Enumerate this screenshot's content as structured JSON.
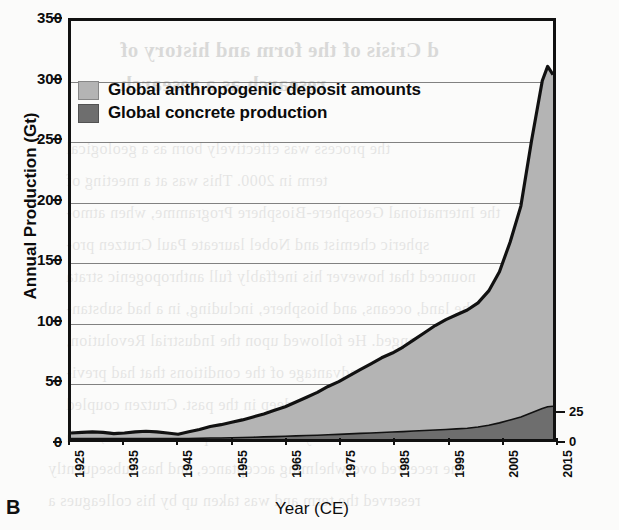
{
  "panel_label": "B",
  "axes": {
    "y_left": {
      "title": "Annual Production (Gt)",
      "ticks": [
        0,
        50,
        100,
        150,
        200,
        250,
        300,
        350
      ],
      "min": 0,
      "max": 350
    },
    "y_right": {
      "title": "",
      "ticks": [
        0,
        25
      ],
      "min": 0,
      "max": 350
    },
    "x": {
      "title": "Year (CE)",
      "ticks": [
        1925,
        1935,
        1945,
        1955,
        1965,
        1975,
        1985,
        1995,
        2005,
        2015
      ],
      "min": 1925,
      "max": 2015
    }
  },
  "legend": {
    "position": "top-left-inside",
    "entries": [
      {
        "label": "Global anthropogenic deposit amounts",
        "color": "#b4b4b4",
        "swatch": "legend-swatch-anthropogenic"
      },
      {
        "label": "Global concrete production",
        "color": "#6e6e6e",
        "swatch": "legend-swatch-concrete"
      }
    ]
  },
  "colors": {
    "anthropogenic_fill": "#b4b4b4",
    "concrete_fill": "#6e6e6e",
    "line": "#111111",
    "grid": "#6b6b6b",
    "frame": "#111111",
    "page": "#fbfbfa"
  },
  "bleed_text": {
    "note": "faint mirrored show-through text from reverse of scanned page",
    "lines": [
      "d Crisis of the form and history of",
      "research as a research",
      "the process was effectively born as a geological",
      "term in 2000. This was at a meeting of",
      "the International Geosphere-Biosphere Programme, when atmo-",
      "spheric chemist and Nobel laureate Paul Crutzen pro-",
      "nounced that however his ineffably full  anthropogenic strata",
      "the land, oceans, and biosphere, including, in a had substan-",
      "tially changed. He followed upon the Industrial Revolution,",
      "taking advantage of the conditions that had previ-",
      "ously been so deep in the past.  Crutzen coupled",
      "the boundary of the Anthropocene in 2000, with",
      "the received overwhelming acceptance, and has subsequently",
      "reserved the term and was taken up by his colleagues a"
    ]
  },
  "chart_data": {
    "type": "area",
    "title": "",
    "subtitle": "",
    "xlabel": "Year (CE)",
    "ylabel": "Annual Production (Gt)",
    "xlim": [
      1925,
      2015
    ],
    "ylim": [
      0,
      350
    ],
    "y2lim": [
      0,
      350
    ],
    "grid": true,
    "stacked": false,
    "legend_position": "upper left",
    "x": [
      1925,
      1927,
      1929,
      1931,
      1933,
      1935,
      1937,
      1939,
      1941,
      1943,
      1945,
      1947,
      1949,
      1951,
      1953,
      1955,
      1957,
      1959,
      1961,
      1963,
      1965,
      1967,
      1969,
      1971,
      1973,
      1975,
      1977,
      1979,
      1981,
      1983,
      1985,
      1987,
      1989,
      1991,
      1993,
      1995,
      1997,
      1999,
      2001,
      2003,
      2005,
      2007,
      2009,
      2011,
      2013,
      2014,
      2015
    ],
    "series": [
      {
        "name": "Global anthropogenic deposit amounts",
        "axis": "left",
        "color": "#b4b4b4",
        "values": [
          5,
          5.5,
          6,
          5.5,
          4.5,
          5,
          6,
          6.5,
          6,
          5,
          4,
          6,
          8,
          10.5,
          12,
          14,
          16,
          18.5,
          21,
          24,
          27,
          31,
          35,
          39,
          44,
          48,
          53,
          58,
          63,
          68,
          72,
          77,
          83,
          89,
          95,
          100,
          104,
          108,
          114,
          124,
          140,
          165,
          195,
          250,
          300,
          312,
          305
        ]
      },
      {
        "name": "Global concrete production",
        "axis": "right",
        "color": "#6e6e6e",
        "values": [
          0.3,
          0.3,
          0.4,
          0.35,
          0.3,
          0.35,
          0.4,
          0.45,
          0.4,
          0.35,
          0.3,
          0.4,
          0.6,
          0.8,
          0.9,
          1.1,
          1.3,
          1.5,
          1.8,
          2.0,
          2.3,
          2.6,
          2.9,
          3.2,
          3.6,
          3.9,
          4.3,
          4.7,
          5.0,
          5.4,
          5.8,
          6.2,
          6.7,
          7.1,
          7.6,
          8.0,
          8.5,
          9.0,
          10.0,
          11.5,
          13.5,
          16.0,
          18.5,
          22.0,
          25.5,
          27.0,
          27.5
        ]
      }
    ]
  }
}
